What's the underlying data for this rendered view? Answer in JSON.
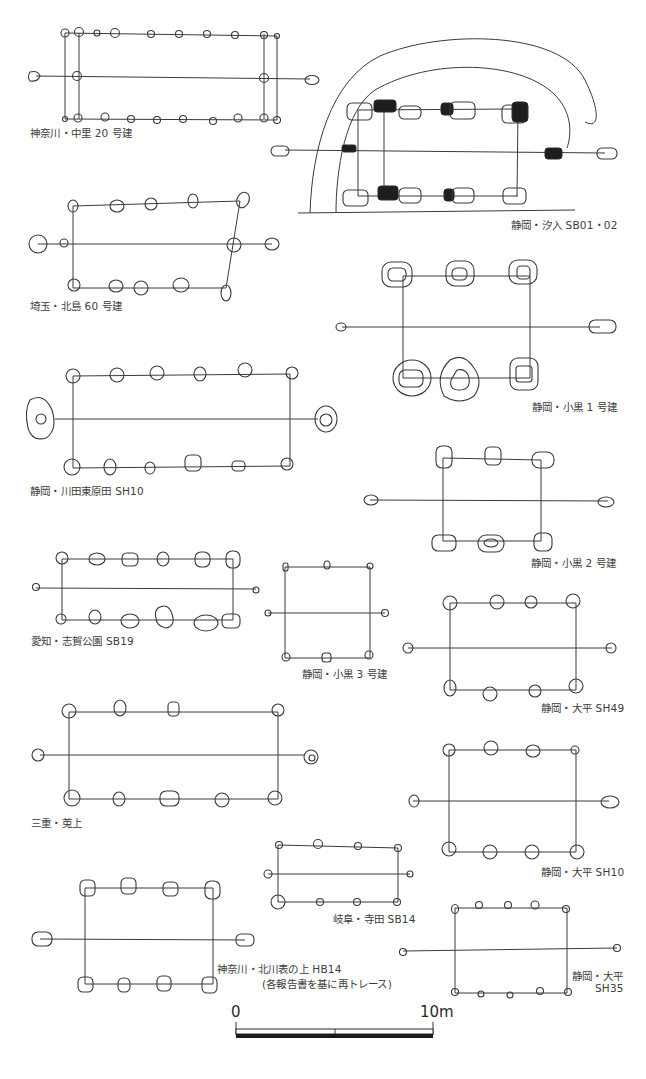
{
  "figure": {
    "note": "(各報告書を基に再トレース)",
    "plans": [
      {
        "id": "nakazato20",
        "label": "神奈川・中里 20 号建"
      },
      {
        "id": "shionyu",
        "label": "静岡・汐入 SB01・02"
      },
      {
        "id": "kitajima60",
        "label": "埼玉・北島 60 号建"
      },
      {
        "id": "koguro1",
        "label": "静岡・小黒 1 号建"
      },
      {
        "id": "kawadahigashi",
        "label": "静岡・川田東原田 SH10"
      },
      {
        "id": "koguro2",
        "label": "静岡・小黒 2 号建"
      },
      {
        "id": "shigakoen",
        "label": "愛知・志賀公園 SB19"
      },
      {
        "id": "koguro3",
        "label": "静岡・小黒 3 号建"
      },
      {
        "id": "odaira49",
        "label": "静岡・大平 SH49"
      },
      {
        "id": "kouage",
        "label": "三重・莵上"
      },
      {
        "id": "odaira10",
        "label": "静岡・大平 SH10"
      },
      {
        "id": "terada",
        "label": "岐阜・寺田 SB14"
      },
      {
        "id": "kitakawa",
        "label": "神奈川・北川表の上 HB14"
      },
      {
        "id": "odaira35_line1",
        "label": "静岡・大平"
      },
      {
        "id": "odaira35_line2",
        "label": "SH35"
      }
    ]
  },
  "scale_bar": {
    "start_label": "0",
    "end_label": "10m"
  },
  "colors": {
    "ink": "#3a3a3a",
    "background": "#ffffff"
  }
}
